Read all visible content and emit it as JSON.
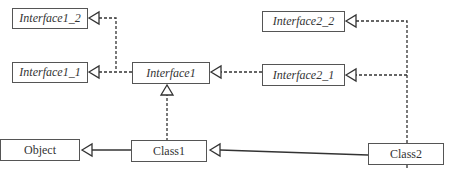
{
  "diagram": {
    "type": "uml-class-diagram",
    "nodes": {
      "interface1_2": {
        "label": "Interface1_2",
        "kind": "interface"
      },
      "interface1_1": {
        "label": "Interface1_1",
        "kind": "interface"
      },
      "interface1": {
        "label": "Interface1",
        "kind": "interface"
      },
      "interface2_2": {
        "label": "Interface2_2",
        "kind": "interface"
      },
      "interface2_1": {
        "label": "Interface2_1",
        "kind": "interface"
      },
      "object": {
        "label": "Object",
        "kind": "class"
      },
      "class1": {
        "label": "Class1",
        "kind": "class"
      },
      "class2": {
        "label": "Class2",
        "kind": "class"
      }
    },
    "edges": [
      {
        "from": "Interface1",
        "to": "Interface1_2",
        "relation": "extends",
        "style": "dashed"
      },
      {
        "from": "Interface1",
        "to": "Interface1_1",
        "relation": "extends",
        "style": "dashed"
      },
      {
        "from": "Interface2_1",
        "to": "Interface1",
        "relation": "extends",
        "style": "dashed"
      },
      {
        "from": "Class2",
        "to": "Interface2_2",
        "relation": "implements",
        "style": "dashed"
      },
      {
        "from": "Class2",
        "to": "Interface2_1",
        "relation": "implements",
        "style": "dashed"
      },
      {
        "from": "Class1",
        "to": "Interface1",
        "relation": "implements",
        "style": "dashed"
      },
      {
        "from": "Class1",
        "to": "Object",
        "relation": "extends",
        "style": "solid"
      },
      {
        "from": "Class2",
        "to": "Class1",
        "relation": "extends",
        "style": "solid"
      }
    ],
    "colors": {
      "line": "#333333",
      "box_border": "#555555",
      "text": "#333333"
    }
  }
}
